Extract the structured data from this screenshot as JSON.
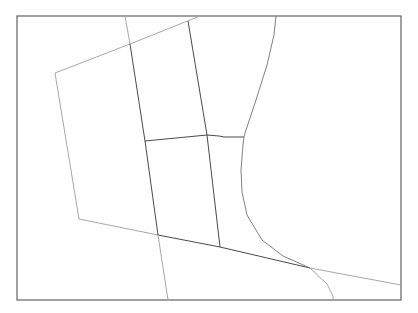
{
  "map": {
    "width": 418,
    "height": 313,
    "background": "#ffffff",
    "frame": {
      "x": 17,
      "y": 16,
      "width": 384,
      "height": 284,
      "stroke": "#6e6e6e"
    },
    "boundaries": [
      {
        "name": "outer-west-boundary",
        "tone": "light",
        "points": "200,16 130,44 55,73 79,219 158,235"
      },
      {
        "name": "south-diagonal-boundary",
        "tone": "dark",
        "points": "158,235 220,247 310,268"
      },
      {
        "name": "south-east-extension",
        "tone": "light",
        "points": "310,268 401,285"
      },
      {
        "name": "west-vertical-upper",
        "tone": "light",
        "points": "125,16 130,44"
      },
      {
        "name": "west-vertical-boundary",
        "tone": "dark",
        "points": "130,44 145,141 158,235"
      },
      {
        "name": "west-vertical-lower",
        "tone": "light",
        "points": "158,235 168,300"
      },
      {
        "name": "middle-vertical-boundary",
        "tone": "dark",
        "points": "188,21 207,135 220,247"
      },
      {
        "name": "cross-boundary",
        "tone": "dark",
        "points": "145,141 207,135 219,136 224,137 244,137"
      },
      {
        "name": "river-boundary",
        "tone": "mid",
        "points": "276,16 274,35 267,65 256,100 246,130 244,137 243,145 241,170 242,192 247,215 262,240 283,256 310,268"
      },
      {
        "name": "river-south-extension",
        "tone": "light",
        "points": "310,268 327,284 333,296 333,300"
      }
    ]
  }
}
